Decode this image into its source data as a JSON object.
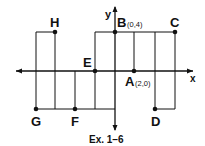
{
  "caption": "Ex. 1–6",
  "axes": {
    "x_label": "x",
    "y_label": "y"
  },
  "points": [
    {
      "name": "A",
      "coord_label": "(2,0)",
      "x": 2,
      "y": 0
    },
    {
      "name": "B",
      "coord_label": "(0,4)",
      "x": 0,
      "y": 4
    },
    {
      "name": "C",
      "coord_label": "",
      "x": 6,
      "y": 4
    },
    {
      "name": "D",
      "coord_label": "",
      "x": 4,
      "y": -4
    },
    {
      "name": "E",
      "coord_label": "",
      "x": -2,
      "y": 0
    },
    {
      "name": "F",
      "coord_label": "",
      "x": -4,
      "y": -4
    },
    {
      "name": "G",
      "coord_label": "",
      "x": -8,
      "y": -4
    },
    {
      "name": "H",
      "coord_label": "",
      "x": -6,
      "y": 4
    }
  ],
  "colors": {
    "ink": "#111111",
    "background": "#ffffff"
  }
}
